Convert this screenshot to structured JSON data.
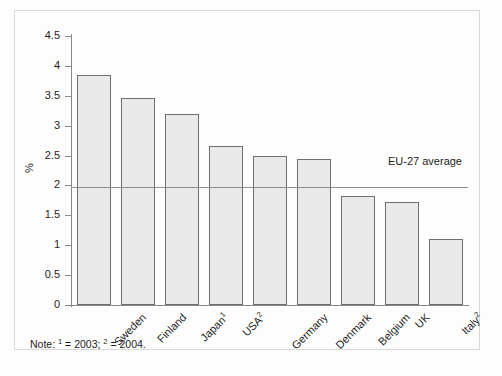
{
  "figure": {
    "note": "Note:  = 2003;  = 2004.",
    "note_prefix": "Note: ",
    "note_mid": " = 2003; ",
    "note_end": " = 2004.",
    "note_sup1": "1",
    "note_sup2": "2",
    "background_color": "#fdfdfd",
    "frame_color": "#d9d9d9"
  },
  "chart_data": {
    "type": "bar",
    "title": "",
    "xlabel": "",
    "ylabel": "%",
    "ylim": [
      0,
      4.5
    ],
    "ytick_labels": [
      "0",
      "0.5",
      "1",
      "1.5",
      "2",
      "2.5",
      "3",
      "3.5",
      "4",
      "4.5"
    ],
    "ytick_values": [
      0,
      0.5,
      1,
      1.5,
      2,
      2.5,
      3,
      3.5,
      4,
      4.5
    ],
    "grid": false,
    "legend": "none",
    "bar_fill_color": "#e9e9e9",
    "bar_edge_color": "#6f6f6f",
    "categories": [
      "Sweden",
      "Finland",
      "Japan",
      "USA",
      "Germany",
      "Denmark",
      "Belgium",
      "UK",
      "Italy"
    ],
    "category_footnotes": [
      "",
      "",
      "1",
      "2",
      "",
      "",
      "",
      "",
      "2"
    ],
    "values": [
      3.85,
      3.47,
      3.2,
      2.66,
      2.5,
      2.45,
      1.82,
      1.73,
      1.1
    ],
    "annotations": [
      {
        "name": "eu-27-average",
        "label": "EU-27 average",
        "value": 1.97,
        "type": "hline",
        "color": "#8d8d8d"
      }
    ]
  }
}
